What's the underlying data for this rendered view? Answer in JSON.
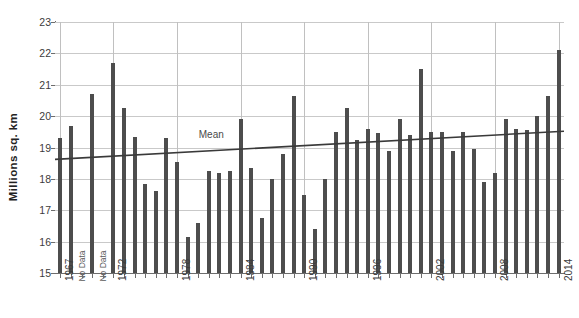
{
  "chart_data": {
    "type": "bar",
    "title": "",
    "xlabel": "",
    "ylabel": "Millions sq. km",
    "ylim": [
      15,
      23
    ],
    "ytick_labels": [
      "15",
      "16",
      "17",
      "18",
      "19",
      "20",
      "21",
      "22",
      "23"
    ],
    "ytick_values": [
      15,
      16,
      17,
      18,
      19,
      20,
      21,
      22,
      23
    ],
    "xtick_labels": [
      "1967",
      "1972",
      "1978",
      "1984",
      "1990",
      "1996",
      "2002",
      "2008",
      "2014"
    ],
    "xtick_values": [
      1967,
      1972,
      1978,
      1984,
      1990,
      1996,
      2002,
      2008,
      2014
    ],
    "grid": true,
    "legend": "none",
    "bar_color": "#4d4d4d",
    "mean_line_color": "#3a3a3a",
    "annotations": [
      {
        "text": "Mean",
        "x": 1981,
        "y": 19.35
      },
      {
        "text": "No Data",
        "x": 1969,
        "y": 15.9
      },
      {
        "text": "No Data",
        "x": 1971,
        "y": 15.9
      }
    ],
    "no_data_years": [
      1969,
      1971
    ],
    "categories": [
      1967,
      1968,
      1969,
      1970,
      1971,
      1972,
      1973,
      1974,
      1975,
      1976,
      1977,
      1978,
      1979,
      1980,
      1981,
      1982,
      1983,
      1984,
      1985,
      1986,
      1987,
      1988,
      1989,
      1990,
      1991,
      1992,
      1993,
      1994,
      1995,
      1996,
      1997,
      1998,
      1999,
      2000,
      2001,
      2002,
      2003,
      2004,
      2005,
      2006,
      2007,
      2008,
      2009,
      2010,
      2011,
      2012,
      2013,
      2014
    ],
    "values": [
      19.3,
      19.7,
      null,
      20.7,
      null,
      21.7,
      20.25,
      19.35,
      17.85,
      17.6,
      19.3,
      18.55,
      16.15,
      16.6,
      18.25,
      18.2,
      18.25,
      19.9,
      18.35,
      16.75,
      18.0,
      18.8,
      20.65,
      17.5,
      16.4,
      18.0,
      19.5,
      20.25,
      19.25,
      19.6,
      19.45,
      18.9,
      19.9,
      19.4,
      21.5,
      19.5,
      19.5,
      18.9,
      19.5,
      18.95,
      17.9,
      18.2,
      19.9,
      19.6,
      19.55,
      20.0,
      20.65,
      22.1
    ],
    "mean_trend": {
      "start_year": 1967,
      "start_value": 18.62,
      "end_year": 2014,
      "end_value": 19.52
    }
  }
}
